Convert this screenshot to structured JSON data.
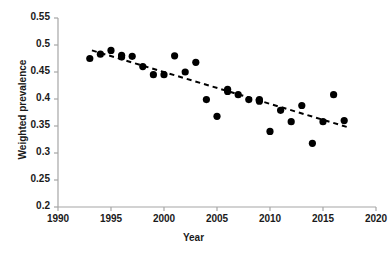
{
  "chart_data": {
    "type": "scatter",
    "title": "",
    "xlabel": "Year",
    "ylabel": "Weighted prevalence",
    "xlim": [
      1990,
      2020
    ],
    "ylim": [
      0.2,
      0.55
    ],
    "xticks": [
      "1990",
      "1995",
      "2000",
      "2005",
      "2010",
      "2015",
      "2020"
    ],
    "yticks": [
      "0.2",
      "0.25",
      "0.3",
      "0.35",
      "0.4",
      "0.45",
      "0.5",
      "0.55"
    ],
    "xtick_values": [
      1990,
      1995,
      2000,
      2005,
      2010,
      2015,
      2020
    ],
    "ytick_values": [
      0.2,
      0.25,
      0.3,
      0.35,
      0.4,
      0.45,
      0.5,
      0.55
    ],
    "grid": false,
    "legend": false,
    "marker": "filled-circle",
    "marker_color": "#000000",
    "axis_color": "#a6a6a6",
    "x": [
      1993,
      1994,
      1995,
      1996,
      1996,
      1997,
      1998,
      1999,
      2000,
      2001,
      2002,
      2003,
      2004,
      2005,
      2006,
      2006,
      2007,
      2008,
      2009,
      2009,
      2010,
      2011,
      2012,
      2013,
      2014,
      2015,
      2016,
      2017
    ],
    "y": [
      0.475,
      0.483,
      0.49,
      0.478,
      0.481,
      0.479,
      0.46,
      0.445,
      0.445,
      0.48,
      0.45,
      0.468,
      0.399,
      0.368,
      0.418,
      0.414,
      0.408,
      0.399,
      0.399,
      0.396,
      0.34,
      0.379,
      0.358,
      0.388,
      0.318,
      0.358,
      0.408,
      0.36
    ],
    "series": [
      {
        "name": "Weighted prevalence",
        "points": [
          {
            "x": 1993,
            "y": 0.475
          },
          {
            "x": 1994,
            "y": 0.483
          },
          {
            "x": 1995,
            "y": 0.49
          },
          {
            "x": 1996,
            "y": 0.478
          },
          {
            "x": 1996,
            "y": 0.481
          },
          {
            "x": 1997,
            "y": 0.479
          },
          {
            "x": 1998,
            "y": 0.46
          },
          {
            "x": 1999,
            "y": 0.445
          },
          {
            "x": 2000,
            "y": 0.445
          },
          {
            "x": 2001,
            "y": 0.48
          },
          {
            "x": 2002,
            "y": 0.45
          },
          {
            "x": 2003,
            "y": 0.468
          },
          {
            "x": 2004,
            "y": 0.399
          },
          {
            "x": 2005,
            "y": 0.368
          },
          {
            "x": 2006,
            "y": 0.418
          },
          {
            "x": 2006,
            "y": 0.414
          },
          {
            "x": 2007,
            "y": 0.408
          },
          {
            "x": 2008,
            "y": 0.399
          },
          {
            "x": 2009,
            "y": 0.399
          },
          {
            "x": 2009,
            "y": 0.396
          },
          {
            "x": 2010,
            "y": 0.34
          },
          {
            "x": 2011,
            "y": 0.379
          },
          {
            "x": 2012,
            "y": 0.358
          },
          {
            "x": 2013,
            "y": 0.388
          },
          {
            "x": 2014,
            "y": 0.318
          },
          {
            "x": 2015,
            "y": 0.358
          },
          {
            "x": 2016,
            "y": 0.408
          },
          {
            "x": 2017,
            "y": 0.36
          }
        ]
      }
    ],
    "trendline": {
      "style": "dashed",
      "color": "#000000",
      "x_start": 1993.2,
      "y_start": 0.49,
      "x_end": 2017.3,
      "y_end": 0.348
    }
  }
}
